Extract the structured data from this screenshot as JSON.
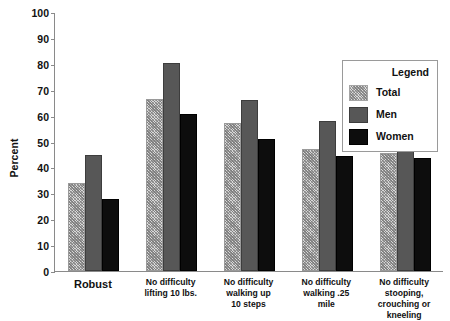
{
  "chart_data": {
    "type": "bar",
    "title": "",
    "xlabel": "",
    "ylabel": "Percent",
    "ylim": [
      0,
      100
    ],
    "ytick_step": 10,
    "yticks": [
      100,
      90,
      80,
      70,
      60,
      50,
      40,
      30,
      20,
      10,
      0
    ],
    "grid": false,
    "legend_position": "upper right",
    "legend_title": "Legend",
    "categories": [
      "Robust",
      "No difficulty\nlifting 10 lbs.",
      "No difficulty\nwalking up\n10 steps",
      "No difficulty\nwalking .25\nmile",
      "No difficulty\nstooping,\ncrouching or\nkneeling"
    ],
    "series": [
      {
        "name": "Total",
        "color": "#d8d8d8",
        "pattern": "crosshatch",
        "values": [
          34,
          66.5,
          57.3,
          47,
          45.5
        ]
      },
      {
        "name": "Men",
        "color": "#575757",
        "pattern": "solid",
        "values": [
          44.8,
          80.5,
          66.2,
          58,
          53.5
        ]
      },
      {
        "name": "Women",
        "color": "#0d0d0d",
        "pattern": "solid",
        "values": [
          27.8,
          60.5,
          50.8,
          44.5,
          43.5
        ]
      }
    ]
  },
  "axis": {
    "y_title": "Percent",
    "y_ticks": [
      "100",
      "90",
      "80",
      "70",
      "60",
      "50",
      "40",
      "30",
      "20",
      "10",
      "0"
    ]
  },
  "legend": {
    "title": "Legend",
    "entries": [
      {
        "label": "Total"
      },
      {
        "label": "Men"
      },
      {
        "label": "Women"
      }
    ]
  },
  "x_labels": [
    "Robust",
    "No difficulty\nlifting 10 lbs.",
    "No difficulty\nwalking up\n10 steps",
    "No difficulty\nwalking .25\nmile",
    "No difficulty\nstooping,\ncrouching or\nkneeling"
  ]
}
